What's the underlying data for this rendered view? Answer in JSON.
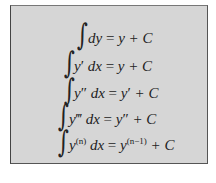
{
  "formula_box": {
    "background": "#d6d6d6",
    "equations": [
      {
        "integrand": "dy",
        "result": "y + C"
      },
      {
        "integrand": "y′ dx",
        "result": "y + C"
      },
      {
        "integrand": "y″ dx",
        "result": "y′ + C"
      },
      {
        "integrand": "y‴ dx",
        "result": "y″ + C"
      },
      {
        "integrand": "y(n) dx",
        "result": "y(n−1) + C"
      }
    ]
  },
  "symbols": {
    "integral": "∫",
    "equals": "="
  },
  "parts": {
    "e0_lhs": "dy",
    "e0_rhs": "y + C",
    "e1_y": "y",
    "e1_p": "′",
    "e1_dx": "dx",
    "e1_rhs": "y + C",
    "e2_y": "y",
    "e2_p": "″",
    "e2_dx": "dx",
    "e2_rhs_y": "y",
    "e2_rhs_p": "′",
    "e2_rhs_c": "+ C",
    "e3_y": "y",
    "e3_p": "‴",
    "e3_dx": "dx",
    "e3_rhs_y": "y",
    "e3_rhs_p": "″",
    "e3_rhs_c": "+ C",
    "e4_y": "y",
    "e4_sup": "(n)",
    "e4_dx": "dx",
    "e4_rhs_y": "y",
    "e4_rhs_sup": "(n−1)",
    "e4_rhs_c": "+ C"
  }
}
